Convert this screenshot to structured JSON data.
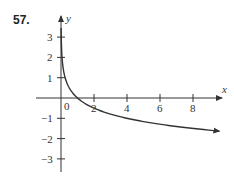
{
  "problem_number": "57.",
  "chart_data": {
    "type": "line",
    "title": "",
    "xlabel": "x",
    "ylabel": "y",
    "function": "y = -log_4(x)",
    "x_ticks": [
      2,
      4,
      6,
      8
    ],
    "y_ticks": [
      3,
      2,
      1,
      -1,
      -2,
      -3
    ],
    "origin_label": "0",
    "xlim": [
      -1.5,
      10
    ],
    "ylim": [
      -3.8,
      3.7
    ],
    "grid": false,
    "series": [
      {
        "name": "curve",
        "x": [
          0.0625,
          0.125,
          0.25,
          0.5,
          1,
          2,
          4,
          6,
          8,
          9.6
        ],
        "y": [
          2,
          1.5,
          1,
          0.5,
          0,
          -0.5,
          -1,
          -1.29,
          -1.5,
          -1.63
        ]
      }
    ]
  },
  "colors": {
    "axis": "#333333",
    "curve": "#333333"
  }
}
